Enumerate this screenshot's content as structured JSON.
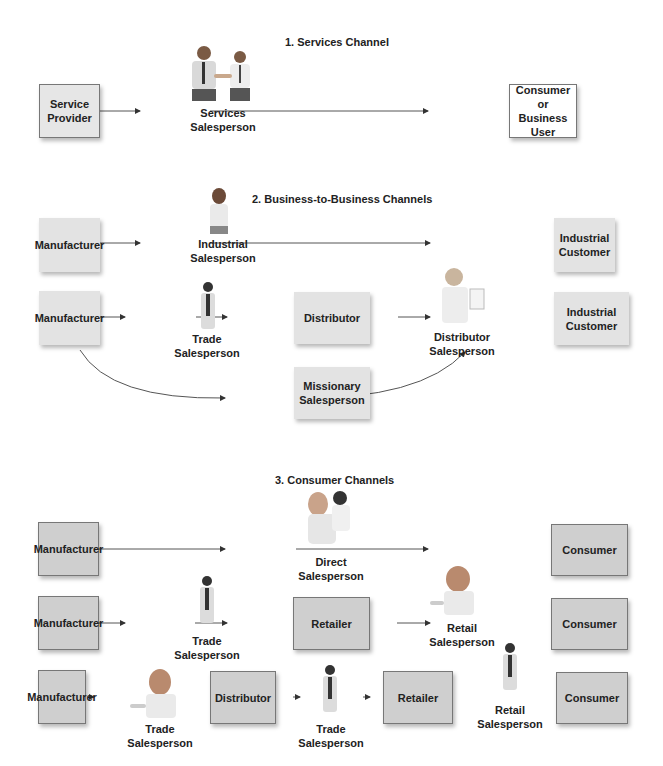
{
  "sections": {
    "services": {
      "title": "1. Services Channel",
      "boxes": {
        "provider": "Service\nProvider",
        "consumer": "Consumer or\nBusiness User"
      },
      "people": {
        "services_sales": "Services\nSalesperson"
      }
    },
    "b2b": {
      "title": "2. Business-to-Business Channels",
      "row1": {
        "manufacturer": "Manufacturer",
        "person": "Industrial\nSalesperson",
        "customer": "Industrial\nCustomer"
      },
      "row2": {
        "manufacturer": "Manufacturer",
        "person1": "Trade\nSalesperson",
        "distributor": "Distributor",
        "person2": "Distributor\nSalesperson",
        "customer": "Industrial\nCustomer"
      },
      "missionary": "Missionary\nSalesperson"
    },
    "consumer": {
      "title": "3. Consumer Channels",
      "row1": {
        "manufacturer": "Manufacturer",
        "person": "Direct\nSalesperson",
        "consumer": "Consumer"
      },
      "row2": {
        "manufacturer": "Manufacturer",
        "person1": "Trade\nSalesperson",
        "retailer": "Retailer",
        "person2": "Retail\nSalesperson",
        "consumer": "Consumer"
      },
      "row3": {
        "manufacturer": "Manufacturer",
        "person1": "Trade\nSalesperson",
        "distributor": "Distributor",
        "person2": "Trade\nSalesperson",
        "retailer": "Retailer",
        "person3": "Retail\nSalesperson",
        "consumer": "Consumer"
      }
    }
  },
  "colors": {
    "box_white": "#ffffff",
    "box_light": "#e3e3e3",
    "box_mid": "#cfcfcf",
    "arrow": "#333333"
  }
}
